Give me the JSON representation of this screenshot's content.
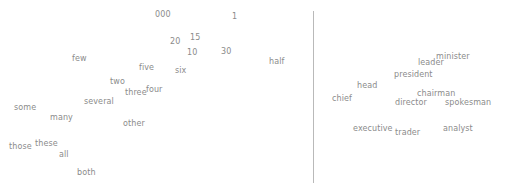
{
  "figure": {
    "title": "",
    "background_color": "#ffffff",
    "label_color": "#8b8b8b",
    "divider_color": "#b9b9b9",
    "divider": {
      "x": 313,
      "y_top": 11,
      "y_bottom": 183
    }
  },
  "chart_data": {
    "type": "scatter",
    "title": "",
    "xlabel": "",
    "ylabel": "",
    "grid": false,
    "axes_visible": false,
    "legend": "none",
    "note": "Two-panel word-embedding scatter plot; each point is rendered as its word label only (no marker). Coordinates are label top-left positions in pixels within the 505x190 image.",
    "panels": [
      {
        "name": "quantifier-words",
        "side": "left",
        "x_range": [
          0,
          313
        ],
        "y_range": [
          0,
          190
        ],
        "points": [
          {
            "label": "000",
            "x": 155,
            "y": 10
          },
          {
            "label": "1",
            "x": 232,
            "y": 12
          },
          {
            "label": "20",
            "x": 170,
            "y": 37
          },
          {
            "label": "15",
            "x": 190,
            "y": 33
          },
          {
            "label": "10",
            "x": 187,
            "y": 48
          },
          {
            "label": "30",
            "x": 221,
            "y": 47
          },
          {
            "label": "few",
            "x": 72,
            "y": 54
          },
          {
            "label": "half",
            "x": 269,
            "y": 57
          },
          {
            "label": "five",
            "x": 139,
            "y": 63
          },
          {
            "label": "six",
            "x": 175,
            "y": 66
          },
          {
            "label": "two",
            "x": 110,
            "y": 77
          },
          {
            "label": "four",
            "x": 146,
            "y": 85
          },
          {
            "label": "three",
            "x": 125,
            "y": 88
          },
          {
            "label": "several",
            "x": 84,
            "y": 97
          },
          {
            "label": "some",
            "x": 14,
            "y": 103
          },
          {
            "label": "many",
            "x": 50,
            "y": 113
          },
          {
            "label": "other",
            "x": 123,
            "y": 119
          },
          {
            "label": "these",
            "x": 35,
            "y": 139
          },
          {
            "label": "those",
            "x": 9,
            "y": 142
          },
          {
            "label": "all",
            "x": 59,
            "y": 150
          },
          {
            "label": "both",
            "x": 77,
            "y": 168
          }
        ]
      },
      {
        "name": "person-role-words",
        "side": "right",
        "x_range": [
          314,
          505
        ],
        "y_range": [
          0,
          190
        ],
        "points": [
          {
            "label": "minister",
            "x": 436,
            "y": 52
          },
          {
            "label": "leader",
            "x": 418,
            "y": 58
          },
          {
            "label": "president",
            "x": 394,
            "y": 70
          },
          {
            "label": "head",
            "x": 357,
            "y": 81
          },
          {
            "label": "chairman",
            "x": 417,
            "y": 89
          },
          {
            "label": "chief",
            "x": 332,
            "y": 94
          },
          {
            "label": "director",
            "x": 395,
            "y": 98
          },
          {
            "label": "spokesman",
            "x": 445,
            "y": 98
          },
          {
            "label": "executive",
            "x": 353,
            "y": 124
          },
          {
            "label": "analyst",
            "x": 443,
            "y": 124
          },
          {
            "label": "trader",
            "x": 395,
            "y": 128
          }
        ]
      }
    ]
  }
}
